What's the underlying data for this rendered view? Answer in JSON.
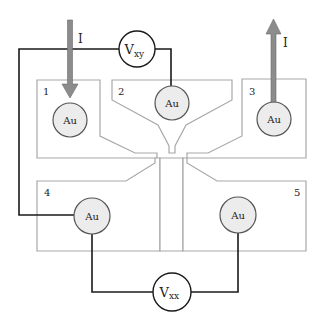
{
  "diagram": {
    "type": "Hall bar measurement schematic",
    "pads": [
      {
        "id": "1",
        "label": "1",
        "contact": "Au"
      },
      {
        "id": "2",
        "label": "2",
        "contact": "Au"
      },
      {
        "id": "3",
        "label": "3",
        "contact": "Au"
      },
      {
        "id": "4",
        "label": "4",
        "contact": "Au"
      },
      {
        "id": "5",
        "label": "5",
        "contact": "Au"
      }
    ],
    "meters": {
      "vxy": {
        "main": "V",
        "sub": "xy"
      },
      "vxx": {
        "main": "V",
        "sub": "xx"
      }
    },
    "currents": {
      "in": {
        "label": "I",
        "direction": "down",
        "pad": "1"
      },
      "out": {
        "label": "I",
        "direction": "up",
        "pad": "3"
      }
    },
    "colors": {
      "pad_outline": "#a8a8a8",
      "contact_fill": "#ececec",
      "wire": "#1a1a1a",
      "arrow": "#8c8c8c"
    }
  }
}
